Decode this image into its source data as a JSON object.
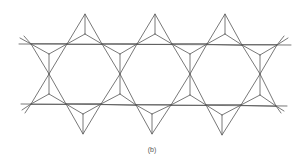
{
  "figure": {
    "caption": "(b)",
    "stroke_color": "#555555",
    "background": "#ffffff",
    "top_line": {
      "x1": 19,
      "y1": 44,
      "x2": 291,
      "y2": 45
    },
    "bottom_line": {
      "x1": 21,
      "y1": 104,
      "x2": 287,
      "y2": 106
    },
    "top_peaks": [
      {
        "apex": [
          85,
          14
        ],
        "center": [
          85,
          34
        ],
        "left": [
          67,
          44
        ],
        "right": [
          102,
          44
        ]
      },
      {
        "apex": [
          155,
          14
        ],
        "center": [
          155,
          34
        ],
        "left": [
          137,
          44
        ],
        "right": [
          172,
          44
        ]
      },
      {
        "apex": [
          225,
          14
        ],
        "center": [
          225,
          34
        ],
        "left": [
          207,
          44
        ],
        "right": [
          242,
          44
        ]
      }
    ],
    "mid_vertices": [
      [
        49,
        74
      ],
      [
        120,
        74
      ],
      [
        190,
        74
      ],
      [
        260,
        74
      ]
    ],
    "bottom_peaks": [
      {
        "apex": [
          83,
          134
        ],
        "center": [
          83,
          114
        ],
        "left": [
          66,
          104
        ],
        "right": [
          101,
          104
        ]
      },
      {
        "apex": [
          152,
          134
        ],
        "center": [
          152,
          114
        ],
        "left": [
          136,
          105
        ],
        "right": [
          171,
          105
        ]
      },
      {
        "apex": [
          222,
          135
        ],
        "center": [
          222,
          115
        ],
        "left": [
          206,
          105
        ],
        "right": [
          241,
          105
        ]
      }
    ]
  }
}
